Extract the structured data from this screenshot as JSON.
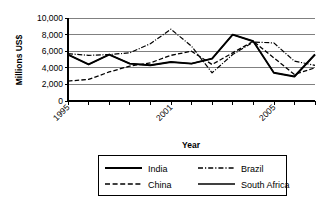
{
  "chart_data": {
    "type": "line",
    "title": "",
    "xlabel": "Year",
    "ylabel": "Millions US$",
    "ylim": [
      0,
      10000
    ],
    "ytick_labels": [
      "10,000",
      "8,000",
      "6,000",
      "4,000",
      "2,000",
      "0"
    ],
    "ytick_values": [
      10000,
      8000,
      6000,
      4000,
      2000,
      0
    ],
    "grid": true,
    "legend_position": "bottom",
    "x": [
      1995,
      1996,
      1997,
      1998,
      1999,
      2000,
      2001,
      2002,
      2003,
      2004,
      2005,
      2006,
      2007
    ],
    "xtick_labels": [
      "1995",
      "",
      "",
      "",
      "",
      "",
      "2001",
      "",
      "",
      "",
      "2005",
      "",
      ""
    ],
    "xlim": [
      1995,
      2007
    ],
    "series": [
      {
        "name": "India",
        "style": "solid-thick",
        "values": [
          5600,
          4400,
          5600,
          4500,
          4300,
          4700,
          4500,
          5100,
          8000,
          7200,
          3400,
          2950,
          5600
        ]
      },
      {
        "name": "Brazil",
        "style": "dash-dot",
        "values": [
          5700,
          5500,
          5600,
          5800,
          6900,
          8650,
          6600,
          3400,
          5600,
          7100,
          7000,
          4800,
          4300
        ]
      },
      {
        "name": "China",
        "style": "dashed",
        "values": [
          2400,
          2600,
          3500,
          4200,
          4600,
          5500,
          6000,
          4400,
          5800,
          7200,
          5200,
          3200,
          4000
        ]
      },
      {
        "name": "South Africa",
        "style": "solid-thin",
        "values": [
          5600,
          4400,
          5600,
          4500,
          4300,
          4700,
          4500,
          5100,
          8000,
          7200,
          3400,
          2950,
          5600
        ]
      }
    ]
  },
  "legend": {
    "items": [
      {
        "label": "India",
        "style": "solid-thick"
      },
      {
        "label": "Brazil",
        "style": "dash-dot"
      },
      {
        "label": "China",
        "style": "dashed"
      },
      {
        "label": "South Africa",
        "style": "solid-thin"
      }
    ]
  },
  "axis": {
    "x_title": "Year",
    "y_title": "Millions US$"
  }
}
